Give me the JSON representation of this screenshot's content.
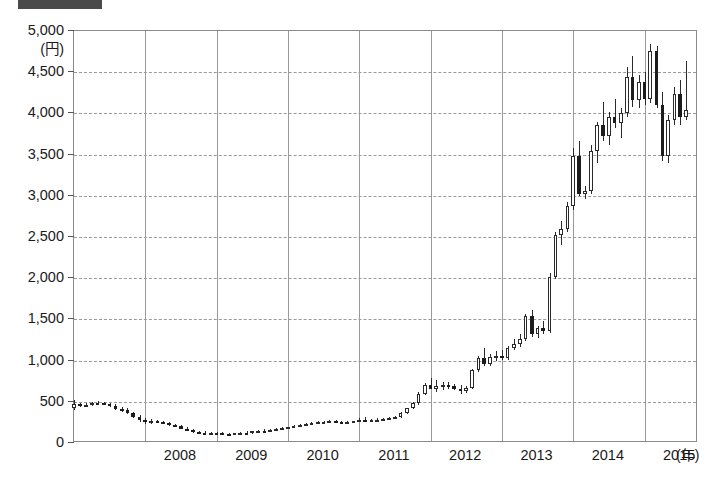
{
  "header": {
    "bar_color": "#4a4a4a"
  },
  "chart_data": {
    "type": "candlestick",
    "title": "",
    "xlabel": "(年)",
    "ylabel": "(円)",
    "ylim": [
      0,
      5000
    ],
    "ytick_step": 500,
    "ytick_labels": [
      "5,000",
      "4,500",
      "4,000",
      "3,500",
      "3,000",
      "2,500",
      "2,000",
      "1,500",
      "1,000",
      "500",
      "0"
    ],
    "ytick_values": [
      5000,
      4500,
      4000,
      3500,
      3000,
      2500,
      2000,
      1500,
      1000,
      500,
      0
    ],
    "xtick_labels": [
      "2008",
      "2009",
      "2010",
      "2011",
      "2012",
      "2013",
      "2014",
      "2015"
    ],
    "xlim_years": [
      2007.0,
      2015.75
    ],
    "grid": {
      "horizontal": "dashed",
      "vertical": "solid"
    },
    "legend": null,
    "colors": {
      "up_body": "#ffffff",
      "down_body": "#1c1c1c",
      "outline": "#2a2a2a",
      "grid": "#9a9a9a",
      "axis": "#8a8a8a"
    },
    "series_name": "株価",
    "candles": [
      {
        "t": 2007.0,
        "o": 430,
        "h": 520,
        "l": 400,
        "c": 470
      },
      {
        "t": 2007.08,
        "o": 470,
        "h": 490,
        "l": 440,
        "c": 455
      },
      {
        "t": 2007.17,
        "o": 455,
        "h": 480,
        "l": 440,
        "c": 465
      },
      {
        "t": 2007.25,
        "o": 465,
        "h": 500,
        "l": 455,
        "c": 490
      },
      {
        "t": 2007.33,
        "o": 490,
        "h": 510,
        "l": 470,
        "c": 480
      },
      {
        "t": 2007.42,
        "o": 480,
        "h": 500,
        "l": 460,
        "c": 470
      },
      {
        "t": 2007.5,
        "o": 470,
        "h": 490,
        "l": 440,
        "c": 455
      },
      {
        "t": 2007.58,
        "o": 455,
        "h": 470,
        "l": 400,
        "c": 415
      },
      {
        "t": 2007.67,
        "o": 415,
        "h": 440,
        "l": 380,
        "c": 395
      },
      {
        "t": 2007.75,
        "o": 395,
        "h": 420,
        "l": 350,
        "c": 365
      },
      {
        "t": 2007.83,
        "o": 365,
        "h": 380,
        "l": 300,
        "c": 320
      },
      {
        "t": 2007.92,
        "o": 320,
        "h": 345,
        "l": 260,
        "c": 275
      },
      {
        "t": 2008.0,
        "o": 275,
        "h": 300,
        "l": 230,
        "c": 250
      },
      {
        "t": 2008.08,
        "o": 250,
        "h": 290,
        "l": 230,
        "c": 270
      },
      {
        "t": 2008.17,
        "o": 270,
        "h": 285,
        "l": 240,
        "c": 250
      },
      {
        "t": 2008.25,
        "o": 250,
        "h": 270,
        "l": 225,
        "c": 240
      },
      {
        "t": 2008.33,
        "o": 240,
        "h": 255,
        "l": 205,
        "c": 215
      },
      {
        "t": 2008.42,
        "o": 215,
        "h": 235,
        "l": 195,
        "c": 205
      },
      {
        "t": 2008.5,
        "o": 205,
        "h": 215,
        "l": 165,
        "c": 175
      },
      {
        "t": 2008.58,
        "o": 175,
        "h": 195,
        "l": 150,
        "c": 160
      },
      {
        "t": 2008.67,
        "o": 160,
        "h": 175,
        "l": 120,
        "c": 130
      },
      {
        "t": 2008.75,
        "o": 130,
        "h": 150,
        "l": 110,
        "c": 125
      },
      {
        "t": 2008.83,
        "o": 125,
        "h": 140,
        "l": 105,
        "c": 115
      },
      {
        "t": 2008.92,
        "o": 115,
        "h": 130,
        "l": 100,
        "c": 120
      },
      {
        "t": 2009.0,
        "o": 120,
        "h": 135,
        "l": 105,
        "c": 118
      },
      {
        "t": 2009.08,
        "o": 118,
        "h": 130,
        "l": 95,
        "c": 105
      },
      {
        "t": 2009.17,
        "o": 105,
        "h": 120,
        "l": 90,
        "c": 100
      },
      {
        "t": 2009.25,
        "o": 100,
        "h": 125,
        "l": 95,
        "c": 118
      },
      {
        "t": 2009.33,
        "o": 118,
        "h": 135,
        "l": 105,
        "c": 125
      },
      {
        "t": 2009.42,
        "o": 125,
        "h": 140,
        "l": 110,
        "c": 120
      },
      {
        "t": 2009.5,
        "o": 120,
        "h": 145,
        "l": 115,
        "c": 140
      },
      {
        "t": 2009.58,
        "o": 140,
        "h": 160,
        "l": 130,
        "c": 150
      },
      {
        "t": 2009.67,
        "o": 150,
        "h": 165,
        "l": 135,
        "c": 145
      },
      {
        "t": 2009.75,
        "o": 145,
        "h": 170,
        "l": 140,
        "c": 160
      },
      {
        "t": 2009.83,
        "o": 160,
        "h": 180,
        "l": 150,
        "c": 170
      },
      {
        "t": 2009.92,
        "o": 170,
        "h": 190,
        "l": 160,
        "c": 180
      },
      {
        "t": 2010.0,
        "o": 180,
        "h": 200,
        "l": 170,
        "c": 192
      },
      {
        "t": 2010.08,
        "o": 192,
        "h": 215,
        "l": 185,
        "c": 205
      },
      {
        "t": 2010.17,
        "o": 205,
        "h": 230,
        "l": 198,
        "c": 222
      },
      {
        "t": 2010.25,
        "o": 222,
        "h": 245,
        "l": 212,
        "c": 235
      },
      {
        "t": 2010.33,
        "o": 235,
        "h": 255,
        "l": 225,
        "c": 245
      },
      {
        "t": 2010.42,
        "o": 245,
        "h": 265,
        "l": 235,
        "c": 250
      },
      {
        "t": 2010.5,
        "o": 250,
        "h": 270,
        "l": 238,
        "c": 258
      },
      {
        "t": 2010.58,
        "o": 258,
        "h": 285,
        "l": 248,
        "c": 265
      },
      {
        "t": 2010.67,
        "o": 265,
        "h": 280,
        "l": 245,
        "c": 252
      },
      {
        "t": 2010.75,
        "o": 252,
        "h": 268,
        "l": 235,
        "c": 245
      },
      {
        "t": 2010.83,
        "o": 245,
        "h": 262,
        "l": 232,
        "c": 250
      },
      {
        "t": 2010.92,
        "o": 250,
        "h": 272,
        "l": 240,
        "c": 262
      },
      {
        "t": 2011.0,
        "o": 262,
        "h": 300,
        "l": 252,
        "c": 285
      },
      {
        "t": 2011.08,
        "o": 285,
        "h": 310,
        "l": 250,
        "c": 268
      },
      {
        "t": 2011.17,
        "o": 268,
        "h": 295,
        "l": 255,
        "c": 278
      },
      {
        "t": 2011.25,
        "o": 278,
        "h": 300,
        "l": 265,
        "c": 282
      },
      {
        "t": 2011.33,
        "o": 282,
        "h": 305,
        "l": 270,
        "c": 290
      },
      {
        "t": 2011.42,
        "o": 290,
        "h": 315,
        "l": 278,
        "c": 300
      },
      {
        "t": 2011.5,
        "o": 300,
        "h": 330,
        "l": 290,
        "c": 315
      },
      {
        "t": 2011.58,
        "o": 315,
        "h": 380,
        "l": 305,
        "c": 365
      },
      {
        "t": 2011.67,
        "o": 365,
        "h": 430,
        "l": 355,
        "c": 420
      },
      {
        "t": 2011.75,
        "o": 420,
        "h": 500,
        "l": 408,
        "c": 480
      },
      {
        "t": 2011.83,
        "o": 480,
        "h": 620,
        "l": 465,
        "c": 600
      },
      {
        "t": 2011.92,
        "o": 600,
        "h": 730,
        "l": 585,
        "c": 700
      },
      {
        "t": 2012.0,
        "o": 700,
        "h": 790,
        "l": 660,
        "c": 660
      },
      {
        "t": 2012.08,
        "o": 660,
        "h": 760,
        "l": 620,
        "c": 690
      },
      {
        "t": 2012.17,
        "o": 690,
        "h": 740,
        "l": 640,
        "c": 700
      },
      {
        "t": 2012.25,
        "o": 700,
        "h": 740,
        "l": 660,
        "c": 690
      },
      {
        "t": 2012.33,
        "o": 690,
        "h": 720,
        "l": 640,
        "c": 660
      },
      {
        "t": 2012.42,
        "o": 660,
        "h": 700,
        "l": 600,
        "c": 625
      },
      {
        "t": 2012.5,
        "o": 625,
        "h": 690,
        "l": 605,
        "c": 670
      },
      {
        "t": 2012.58,
        "o": 670,
        "h": 900,
        "l": 660,
        "c": 880
      },
      {
        "t": 2012.67,
        "o": 880,
        "h": 1060,
        "l": 860,
        "c": 1030
      },
      {
        "t": 2012.75,
        "o": 1030,
        "h": 1150,
        "l": 930,
        "c": 960
      },
      {
        "t": 2012.83,
        "o": 960,
        "h": 1080,
        "l": 940,
        "c": 1040
      },
      {
        "t": 2012.92,
        "o": 1040,
        "h": 1120,
        "l": 1000,
        "c": 1060
      },
      {
        "t": 2013.0,
        "o": 1060,
        "h": 1130,
        "l": 1010,
        "c": 1030
      },
      {
        "t": 2013.08,
        "o": 1030,
        "h": 1180,
        "l": 1010,
        "c": 1150
      },
      {
        "t": 2013.17,
        "o": 1150,
        "h": 1260,
        "l": 1130,
        "c": 1200
      },
      {
        "t": 2013.25,
        "o": 1200,
        "h": 1320,
        "l": 1170,
        "c": 1260
      },
      {
        "t": 2013.33,
        "o": 1260,
        "h": 1560,
        "l": 1240,
        "c": 1540
      },
      {
        "t": 2013.42,
        "o": 1540,
        "h": 1620,
        "l": 1290,
        "c": 1320
      },
      {
        "t": 2013.5,
        "o": 1320,
        "h": 1420,
        "l": 1280,
        "c": 1390
      },
      {
        "t": 2013.58,
        "o": 1390,
        "h": 1480,
        "l": 1320,
        "c": 1360
      },
      {
        "t": 2013.67,
        "o": 1360,
        "h": 2060,
        "l": 1340,
        "c": 2020
      },
      {
        "t": 2013.75,
        "o": 2020,
        "h": 2560,
        "l": 1990,
        "c": 2520
      },
      {
        "t": 2013.83,
        "o": 2520,
        "h": 2700,
        "l": 2400,
        "c": 2600
      },
      {
        "t": 2013.92,
        "o": 2600,
        "h": 2920,
        "l": 2560,
        "c": 2880
      },
      {
        "t": 2014.0,
        "o": 2880,
        "h": 3580,
        "l": 2830,
        "c": 3480
      },
      {
        "t": 2014.08,
        "o": 3480,
        "h": 3660,
        "l": 3000,
        "c": 3020
      },
      {
        "t": 2014.17,
        "o": 3020,
        "h": 3120,
        "l": 2960,
        "c": 3060
      },
      {
        "t": 2014.25,
        "o": 3060,
        "h": 3620,
        "l": 3020,
        "c": 3540
      },
      {
        "t": 2014.33,
        "o": 3540,
        "h": 3900,
        "l": 3400,
        "c": 3860
      },
      {
        "t": 2014.42,
        "o": 3860,
        "h": 4140,
        "l": 3660,
        "c": 3720
      },
      {
        "t": 2014.5,
        "o": 3720,
        "h": 4020,
        "l": 3620,
        "c": 3960
      },
      {
        "t": 2014.58,
        "o": 3960,
        "h": 4180,
        "l": 3820,
        "c": 3880
      },
      {
        "t": 2014.67,
        "o": 3880,
        "h": 4060,
        "l": 3700,
        "c": 4000
      },
      {
        "t": 2014.75,
        "o": 4000,
        "h": 4560,
        "l": 3960,
        "c": 4440
      },
      {
        "t": 2014.83,
        "o": 4440,
        "h": 4700,
        "l": 4080,
        "c": 4160
      },
      {
        "t": 2014.92,
        "o": 4160,
        "h": 4460,
        "l": 4060,
        "c": 4380
      },
      {
        "t": 2015.0,
        "o": 4380,
        "h": 4500,
        "l": 4100,
        "c": 4180
      },
      {
        "t": 2015.08,
        "o": 4180,
        "h": 4840,
        "l": 4120,
        "c": 4760
      },
      {
        "t": 2015.17,
        "o": 4760,
        "h": 4820,
        "l": 4060,
        "c": 4100
      },
      {
        "t": 2015.25,
        "o": 4100,
        "h": 4260,
        "l": 3420,
        "c": 3480
      },
      {
        "t": 2015.33,
        "o": 3480,
        "h": 3980,
        "l": 3400,
        "c": 3920
      },
      {
        "t": 2015.42,
        "o": 3920,
        "h": 4320,
        "l": 3860,
        "c": 4240
      },
      {
        "t": 2015.5,
        "o": 4240,
        "h": 4400,
        "l": 3860,
        "c": 3960
      },
      {
        "t": 2015.58,
        "o": 3960,
        "h": 4640,
        "l": 3920,
        "c": 4040
      }
    ]
  }
}
